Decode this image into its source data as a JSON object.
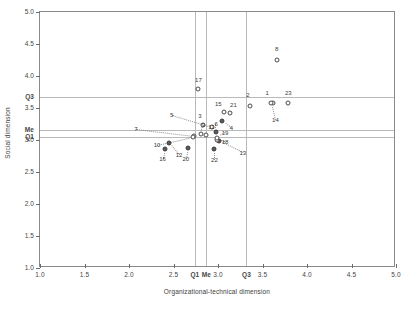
{
  "chart_data": {
    "type": "scatter",
    "title": "",
    "xlabel": "Organizational-technical dimension",
    "ylabel": "Social dimension",
    "xlim": [
      1.0,
      5.0
    ],
    "ylim": [
      1.0,
      5.0
    ],
    "grid": true,
    "legend": null,
    "xticks": [
      "1.0",
      "1.5",
      "2.0",
      "2.5",
      "3.0",
      "3.5",
      "4.0",
      "4.5",
      "5.0"
    ],
    "xtickvalues": [
      1.0,
      1.5,
      2.0,
      2.5,
      3.0,
      3.5,
      4.0,
      4.5,
      5.0
    ],
    "yticks": [
      "1.0",
      "1.5",
      "2.0",
      "2.5",
      "3.0",
      "3.5",
      "4.0",
      "4.5",
      "5.0"
    ],
    "ytickvalues": [
      1.0,
      1.5,
      2.0,
      2.5,
      3.0,
      3.5,
      4.0,
      4.5,
      5.0
    ],
    "x_quartile_lines": [
      {
        "label": "Q1",
        "value": 2.74
      },
      {
        "label": "Me",
        "value": 2.87
      },
      {
        "label": "Q3",
        "value": 3.32
      }
    ],
    "y_quartile_lines": [
      {
        "label": "Q1",
        "value": 3.05
      },
      {
        "label": "Me",
        "value": 3.16
      },
      {
        "label": "Q3",
        "value": 3.67
      }
    ],
    "points": [
      {
        "id": "1",
        "x": 3.62,
        "y": 3.58,
        "marker": "open"
      },
      {
        "id": "2",
        "x": 3.36,
        "y": 3.53,
        "marker": "open"
      },
      {
        "id": "3",
        "x": 2.83,
        "y": 3.23,
        "marker": "open"
      },
      {
        "id": "4",
        "x": 3.05,
        "y": 3.3,
        "marker": "filled"
      },
      {
        "id": "5",
        "x": 2.93,
        "y": 3.2,
        "marker": "open"
      },
      {
        "id": "6",
        "x": 2.98,
        "y": 3.12,
        "marker": "filled"
      },
      {
        "id": "7",
        "x": 2.73,
        "y": 3.06,
        "marker": "open"
      },
      {
        "id": "8",
        "x": 3.66,
        "y": 4.25,
        "marker": "open"
      },
      {
        "id": "9",
        "x": 2.81,
        "y": 3.1,
        "marker": "open"
      },
      {
        "id": "10",
        "x": 2.72,
        "y": 3.05,
        "marker": "open"
      },
      {
        "id": "11",
        "x": 2.87,
        "y": 3.08,
        "marker": "open"
      },
      {
        "id": "12",
        "x": 2.45,
        "y": 2.95,
        "marker": "filled"
      },
      {
        "id": "13",
        "x": 3.01,
        "y": 2.99,
        "marker": "filled"
      },
      {
        "id": "14",
        "x": 3.6,
        "y": 3.58,
        "marker": "open"
      },
      {
        "id": "15",
        "x": 3.07,
        "y": 3.43,
        "marker": "open"
      },
      {
        "id": "16",
        "x": 2.4,
        "y": 2.86,
        "marker": "filled"
      },
      {
        "id": "17",
        "x": 2.78,
        "y": 3.8,
        "marker": "open"
      },
      {
        "id": "18",
        "x": 2.99,
        "y": 3.0,
        "marker": "open"
      },
      {
        "id": "19",
        "x": 2.99,
        "y": 3.03,
        "marker": "open"
      },
      {
        "id": "20",
        "x": 2.66,
        "y": 2.88,
        "marker": "filled"
      },
      {
        "id": "21",
        "x": 3.14,
        "y": 3.42,
        "marker": "open"
      },
      {
        "id": "22",
        "x": 2.96,
        "y": 2.86,
        "marker": "filled"
      },
      {
        "id": "23",
        "x": 3.79,
        "y": 3.58,
        "marker": "open"
      }
    ]
  },
  "axes": {
    "x_title": "Organizational-technical dimension",
    "y_title": "Social dimension"
  }
}
